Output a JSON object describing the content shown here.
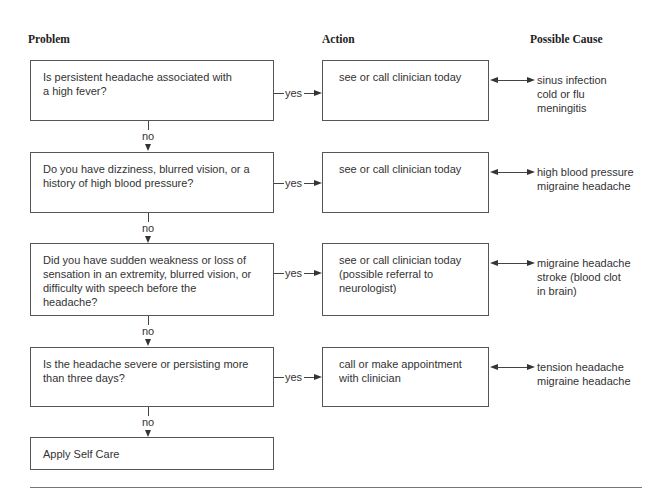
{
  "headers": {
    "problem": "Problem",
    "action": "Action",
    "cause": "Possible Cause"
  },
  "edge_labels": {
    "yes": "yes",
    "no": "no"
  },
  "rows": [
    {
      "problem": "Is persistent headache associated with\na high fever?",
      "action": "see or call clinician today",
      "causes": "sinus infection\ncold or flu\nmeningitis"
    },
    {
      "problem": "Do you have dizziness, blurred vision, or a\nhistory of high blood pressure?",
      "action": "see or call clinician today",
      "causes": "high blood pressure\nmigraine headache"
    },
    {
      "problem": "Did you have sudden weakness or loss of\nsensation in an extremity, blurred vision, or\ndifficulty with speech before the\nheadache?",
      "action": "see or call clinician today\n(possible referral to\nneurologist)",
      "causes": "migraine headache\nstroke (blood clot\n   in brain)"
    },
    {
      "problem": "Is the headache severe or persisting more\nthan three days?",
      "action": "call or make appointment\nwith clinician",
      "causes": "tension headache\nmigraine headache"
    }
  ],
  "terminal": {
    "label": "Apply Self Care"
  }
}
